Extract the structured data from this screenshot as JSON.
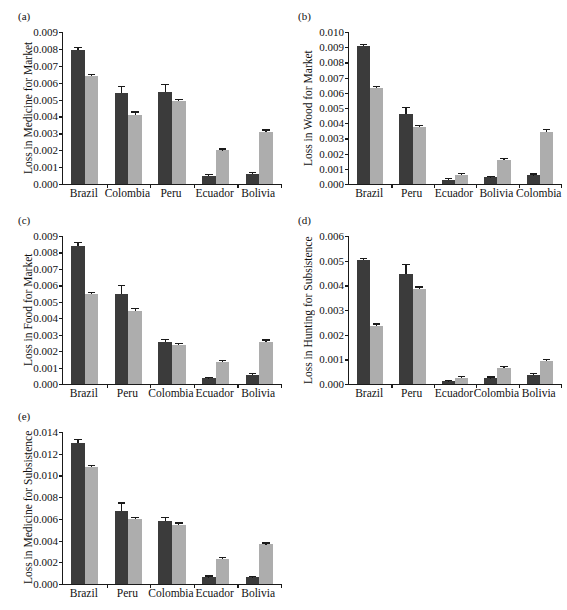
{
  "figure": {
    "title": "",
    "panel_count": 5,
    "series_colors": {
      "dark": "#3b3b3b",
      "light": "#adadad"
    },
    "series_names": [
      "dark-series",
      "light-series"
    ]
  },
  "chart_data": [
    {
      "type": "bar",
      "panel": "(a)",
      "title": "",
      "xlabel": "",
      "ylabel": "Loss in Medicine for Market",
      "ylim": [
        0,
        0.009
      ],
      "yticks": [
        0.0,
        0.001,
        0.002,
        0.003,
        0.004,
        0.005,
        0.006,
        0.007,
        0.008,
        0.009
      ],
      "ytick_labels": [
        "0.000",
        "0.001",
        "0.002",
        "0.003",
        "0.004",
        "0.005",
        "0.006",
        "0.007",
        "0.008",
        "0.009"
      ],
      "grid": false,
      "legend": "none",
      "categories": [
        "Brazil",
        "Colombia",
        "Peru",
        "Ecuador",
        "Bolivia"
      ],
      "series": [
        {
          "name": "dark-series",
          "values": [
            0.00795,
            0.00538,
            0.00543,
            0.00048,
            0.00062
          ],
          "errors": [
            0.0001,
            0.00035,
            0.00045,
            4e-05,
            5e-05
          ]
        },
        {
          "name": "light-series",
          "values": [
            0.00637,
            0.00411,
            0.0049,
            0.002,
            0.00308
          ],
          "errors": [
            6e-05,
            0.00012,
            6e-05,
            4e-05,
            8e-05
          ]
        }
      ]
    },
    {
      "type": "bar",
      "panel": "(b)",
      "title": "",
      "xlabel": "",
      "ylabel": "Loss in Wood for Market",
      "ylim": [
        0,
        0.01
      ],
      "yticks": [
        0.0,
        0.001,
        0.002,
        0.003,
        0.004,
        0.005,
        0.006,
        0.007,
        0.008,
        0.009,
        0.01
      ],
      "ytick_labels": [
        "0.000",
        "0.001",
        "0.002",
        "0.003",
        "0.004",
        "0.005",
        "0.006",
        "0.007",
        "0.008",
        "0.009",
        "0.010"
      ],
      "grid": false,
      "legend": "none",
      "categories": [
        "Brazil",
        "Peru",
        "Ecuador",
        "Bolivia",
        "Colombia"
      ],
      "series": [
        {
          "name": "dark-series",
          "values": [
            0.00905,
            0.0046,
            0.00027,
            0.00044,
            0.00057
          ],
          "errors": [
            0.0001,
            0.00042,
            3e-05,
            4e-05,
            5e-05
          ]
        },
        {
          "name": "light-series",
          "values": [
            0.00633,
            0.00377,
            0.0006,
            0.0016,
            0.00344
          ],
          "errors": [
            6e-05,
            6e-05,
            4e-05,
            4e-05,
            0.0001
          ]
        }
      ]
    },
    {
      "type": "bar",
      "panel": "(c)",
      "title": "",
      "xlabel": "",
      "ylabel": "Loss in Food for Market",
      "ylim": [
        0,
        0.009
      ],
      "yticks": [
        0.0,
        0.001,
        0.002,
        0.003,
        0.004,
        0.005,
        0.006,
        0.007,
        0.008,
        0.009
      ],
      "ytick_labels": [
        "0.000",
        "0.001",
        "0.002",
        "0.003",
        "0.004",
        "0.005",
        "0.006",
        "0.007",
        "0.008",
        "0.009"
      ],
      "grid": false,
      "legend": "none",
      "categories": [
        "Brazil",
        "Peru",
        "Colombia",
        "Ecuador",
        "Bolivia"
      ],
      "series": [
        {
          "name": "dark-series",
          "values": [
            0.0084,
            0.00548,
            0.00257,
            0.00034,
            0.00056
          ],
          "errors": [
            0.00015,
            0.00048,
            0.0001,
            4e-05,
            5e-05
          ]
        },
        {
          "name": "light-series",
          "values": [
            0.00545,
            0.00441,
            0.00237,
            0.00132,
            0.00254
          ],
          "errors": [
            8e-05,
            0.00014,
            6e-05,
            5e-05,
            0.0001
          ]
        }
      ]
    },
    {
      "type": "bar",
      "panel": "(d)",
      "title": "",
      "xlabel": "",
      "ylabel": "Loss in Hunting for Subsistence",
      "ylim": [
        0,
        0.006
      ],
      "yticks": [
        0.0,
        0.001,
        0.002,
        0.003,
        0.004,
        0.005,
        0.006
      ],
      "ytick_labels": [
        "0.000",
        "0.001",
        "0.002",
        "0.003",
        "0.004",
        "0.005",
        "0.006"
      ],
      "grid": false,
      "legend": "none",
      "categories": [
        "Brazil",
        "Peru",
        "Ecuador",
        "Colombia",
        "Bolivia"
      ],
      "series": [
        {
          "name": "dark-series",
          "values": [
            0.00503,
            0.00447,
            0.00011,
            0.00023,
            0.00036
          ],
          "errors": [
            5e-05,
            0.00035,
            2e-05,
            3e-05,
            3e-05
          ]
        },
        {
          "name": "light-series",
          "values": [
            0.00236,
            0.00386,
            0.00026,
            0.00065,
            0.00094
          ],
          "errors": [
            5e-05,
            5e-05,
            3e-05,
            4e-05,
            4e-05
          ]
        }
      ]
    },
    {
      "type": "bar",
      "panel": "(e)",
      "title": "",
      "xlabel": "",
      "ylabel": "Loss in Medicine for Subsistence",
      "ylim": [
        0,
        0.014
      ],
      "yticks": [
        0.0,
        0.002,
        0.004,
        0.006,
        0.008,
        0.01,
        0.012,
        0.014
      ],
      "ytick_labels": [
        "0.000",
        "0.002",
        "0.004",
        "0.006",
        "0.008",
        "0.010",
        "0.012",
        "0.014"
      ],
      "grid": false,
      "legend": "none",
      "categories": [
        "Brazil",
        "Peru",
        "Colombia",
        "Ecuador",
        "Bolivia"
      ],
      "series": [
        {
          "name": "dark-series",
          "values": [
            0.01303,
            0.00668,
            0.00585,
            0.00062,
            0.00061
          ],
          "errors": [
            0.00022,
            0.00072,
            0.00025,
            6e-05,
            5e-05
          ]
        },
        {
          "name": "light-series",
          "values": [
            0.01077,
            0.00595,
            0.00547,
            0.0023,
            0.00364
          ],
          "errors": [
            0.0001,
            0.00014,
            0.0001,
            8e-05,
            8e-05
          ]
        }
      ]
    }
  ],
  "layout": [
    {
      "id": "a",
      "label_x": 18,
      "label_y": 10,
      "plot_x": 62,
      "plot_y": 32,
      "plot_w": 218,
      "plot_h": 152,
      "ylabel_x": 22,
      "ylabel_y": 32,
      "ylabel_h": 152,
      "xlab_y": 187
    },
    {
      "id": "b",
      "label_x": 298,
      "label_y": 10,
      "plot_x": 348,
      "plot_y": 32,
      "plot_w": 212,
      "plot_h": 152,
      "ylabel_x": 302,
      "ylabel_y": 32,
      "ylabel_h": 152,
      "xlab_y": 187
    },
    {
      "id": "c",
      "label_x": 18,
      "label_y": 214,
      "plot_x": 62,
      "plot_y": 236,
      "plot_w": 218,
      "plot_h": 148,
      "ylabel_x": 22,
      "ylabel_y": 236,
      "ylabel_h": 148,
      "xlab_y": 387
    },
    {
      "id": "d",
      "label_x": 298,
      "label_y": 214,
      "plot_x": 348,
      "plot_y": 236,
      "plot_w": 212,
      "plot_h": 148,
      "ylabel_x": 302,
      "ylabel_y": 236,
      "ylabel_h": 148,
      "xlab_y": 387
    },
    {
      "id": "e",
      "label_x": 18,
      "label_y": 410,
      "plot_x": 62,
      "plot_y": 432,
      "plot_w": 218,
      "plot_h": 152,
      "ylabel_x": 22,
      "ylabel_y": 432,
      "ylabel_h": 152,
      "xlab_y": 587
    }
  ]
}
